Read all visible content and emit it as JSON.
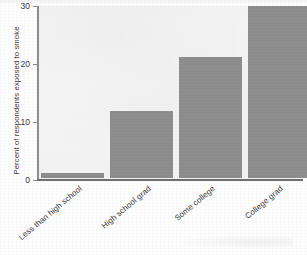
{
  "chart_data": {
    "type": "bar",
    "title": "",
    "subtitle": "",
    "xlabel": "",
    "ylabel": "Percent of respondents exposed to smoke",
    "categories": [
      "Less than high school",
      "High school grad",
      "Some college",
      "College grad"
    ],
    "values": [
      1,
      11.6,
      21,
      29.8
    ],
    "ylim": [
      0,
      30
    ],
    "yticks": [
      0,
      10,
      20,
      30
    ],
    "ytick_labels": [
      "0",
      "10",
      "20",
      "30"
    ],
    "xticks": [],
    "grid": false,
    "legend": null,
    "legend_position": "none",
    "annotations": [],
    "series": [
      {
        "name": "Percent exposed to smoke",
        "values": [
          1,
          11.6,
          21,
          29.8
        ],
        "color": "#8b8b8b"
      }
    ]
  },
  "colors": {
    "bar_fill": "#8b8b8b",
    "plot_background": "#f3f3f3",
    "axis_line": "#8d8d8d",
    "baseline": "#6e6e6e",
    "text": "#3a3a3a",
    "page_background": "#fdfdfd"
  }
}
